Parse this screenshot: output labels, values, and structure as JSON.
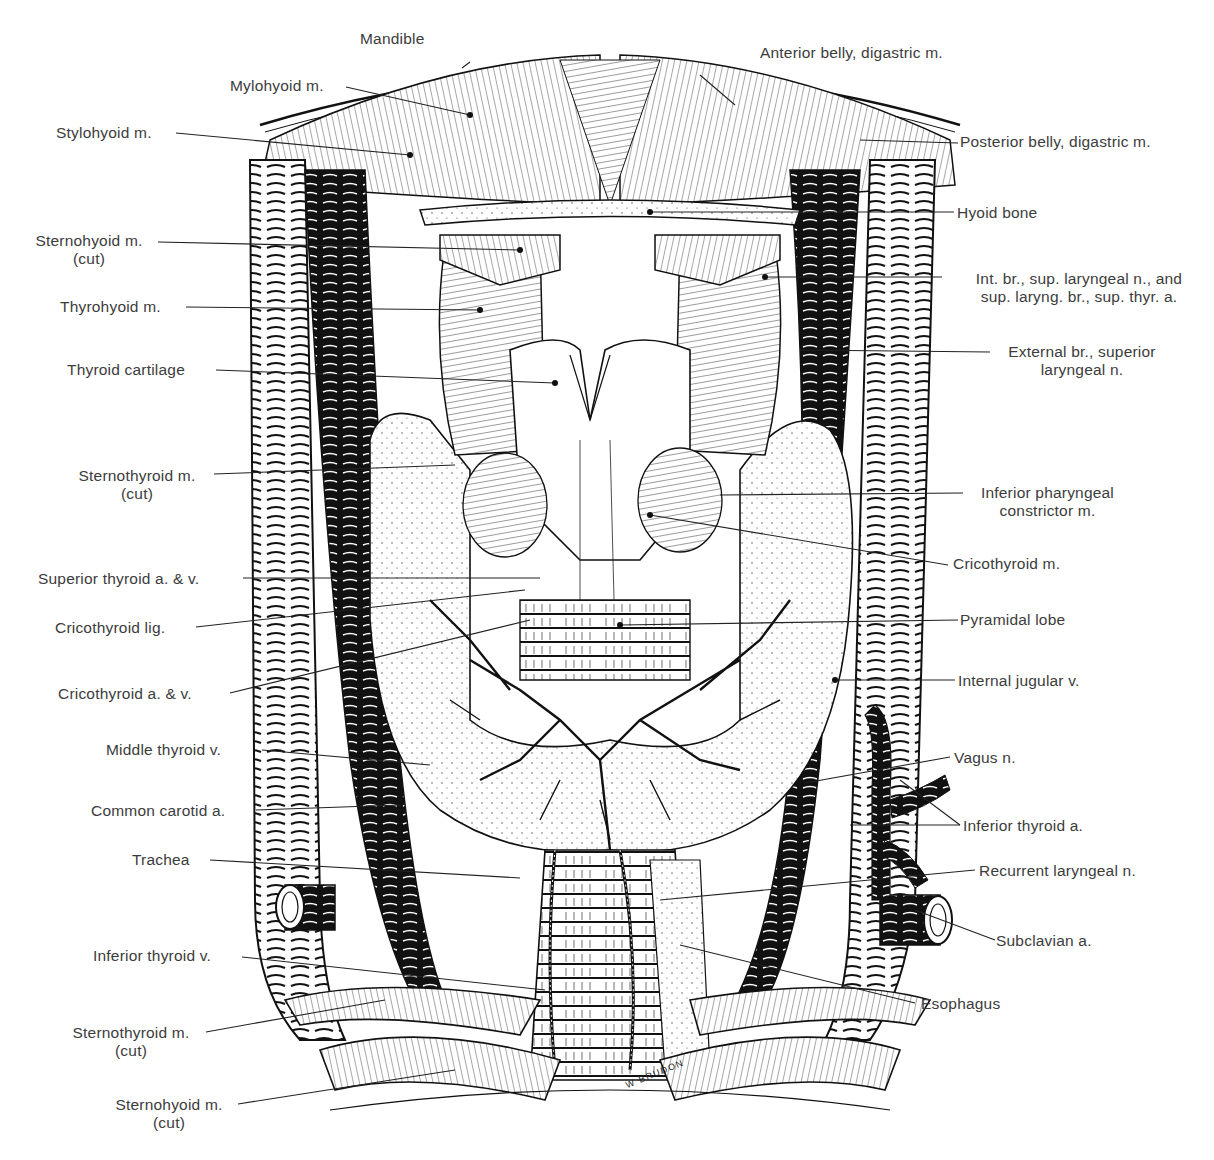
{
  "figure": {
    "signature": "W BRUDON",
    "colors": {
      "ink": "#111111",
      "label_text": "#3c3c3c",
      "background": "#ffffff"
    }
  },
  "labels_left": [
    {
      "id": "mylohyoid",
      "text": "Mylohyoid m.",
      "sub": ""
    },
    {
      "id": "stylohyoid",
      "text": "Stylohyoid m.",
      "sub": ""
    },
    {
      "id": "sternohyoid-top",
      "text": "Sternohyoid m.",
      "sub": "(cut)"
    },
    {
      "id": "thyrohyoid",
      "text": "Thyrohyoid m.",
      "sub": ""
    },
    {
      "id": "thyroid-cartilage",
      "text": "Thyroid cartilage",
      "sub": ""
    },
    {
      "id": "sternothyroid-top",
      "text": "Sternothyroid m.",
      "sub": "(cut)"
    },
    {
      "id": "superior-thyroid",
      "text": "Superior thyroid a. & v.",
      "sub": ""
    },
    {
      "id": "cricothyroid-lig",
      "text": "Cricothyroid lig.",
      "sub": ""
    },
    {
      "id": "cricothyroid-av",
      "text": "Cricothyroid a. & v.",
      "sub": ""
    },
    {
      "id": "middle-thyroid",
      "text": "Middle thyroid v.",
      "sub": ""
    },
    {
      "id": "common-carotid",
      "text": "Common carotid a.",
      "sub": ""
    },
    {
      "id": "trachea",
      "text": "Trachea",
      "sub": ""
    },
    {
      "id": "inferior-thyroid-v",
      "text": "Inferior thyroid v.",
      "sub": ""
    },
    {
      "id": "sternothyroid-bottom",
      "text": "Sternothyroid m.",
      "sub": "(cut)"
    },
    {
      "id": "sternohyoid-bottom",
      "text": "Sternohyoid m.",
      "sub": "(cut)"
    }
  ],
  "labels_top": [
    {
      "id": "mandible",
      "text": "Mandible"
    },
    {
      "id": "anterior-belly",
      "text": "Anterior belly, digastric m."
    }
  ],
  "labels_right": [
    {
      "id": "posterior-belly",
      "text": "Posterior belly, digastric m.",
      "sub": ""
    },
    {
      "id": "hyoid-bone",
      "text": "Hyoid bone",
      "sub": ""
    },
    {
      "id": "int-br",
      "text": "Int. br., sup. laryngeal n., and",
      "sub": "sup. laryng. br., sup. thyr. a."
    },
    {
      "id": "external-br",
      "text": "External br., superior",
      "sub": "laryngeal n."
    },
    {
      "id": "inf-pharyngeal",
      "text": "Inferior pharyngeal",
      "sub": "constrictor m."
    },
    {
      "id": "cricothyroid-m",
      "text": "Cricothyroid m.",
      "sub": ""
    },
    {
      "id": "pyramidal-lobe",
      "text": "Pyramidal lobe",
      "sub": ""
    },
    {
      "id": "internal-jugular",
      "text": "Internal jugular v.",
      "sub": ""
    },
    {
      "id": "vagus",
      "text": "Vagus n.",
      "sub": ""
    },
    {
      "id": "inferior-thyroid-a",
      "text": "Inferior thyroid a.",
      "sub": ""
    },
    {
      "id": "recurrent-laryngeal",
      "text": "Recurrent laryngeal n.",
      "sub": ""
    },
    {
      "id": "subclavian",
      "text": "Subclavian a.",
      "sub": ""
    },
    {
      "id": "esophagus",
      "text": "Esophagus",
      "sub": ""
    }
  ]
}
